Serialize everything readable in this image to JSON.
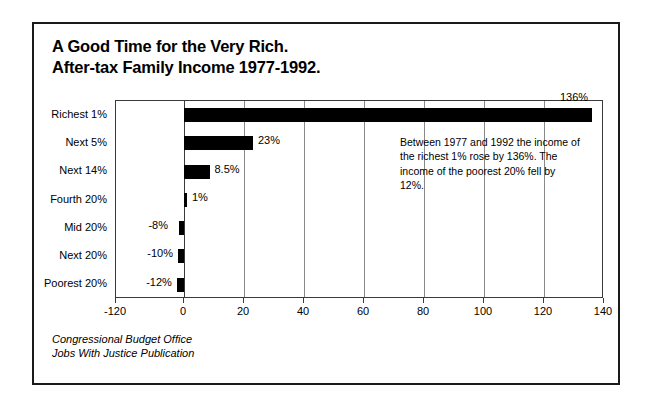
{
  "title": {
    "line1": "A Good Time for the Very Rich.",
    "line2": "After-tax Family Income 1977-1992."
  },
  "annotation": "Between 1977 and 1992 the income of the richest 1% rose by 136%. The income of the poorest 20% fell by 12%.",
  "footer": {
    "line1": "Congressional Budget Office",
    "line2": "Jobs With Justice Publication"
  },
  "chart_data": {
    "type": "bar",
    "orientation": "horizontal",
    "title": "A Good Time for the Very Rich. After-tax Family Income 1977-1992.",
    "xlabel": "",
    "ylabel": "",
    "xlim": [
      -120,
      140
    ],
    "grid": true,
    "legend": "none",
    "bar_color": "#000000",
    "categories": [
      "Richest 1%",
      "Next 5%",
      "Next 14%",
      "Fourth 20%",
      "Mid 20%",
      "Next 20%",
      "Poorest 20%"
    ],
    "values": [
      136,
      23,
      8.5,
      1,
      -8,
      -10,
      -12
    ],
    "data_labels": [
      "136%",
      "23%",
      "8.5%",
      "1%",
      "-8%",
      "-10%",
      "-12%"
    ],
    "xticks": [
      -120,
      0,
      20,
      40,
      60,
      80,
      100,
      120,
      140
    ],
    "xtick_labels": [
      "-120",
      "0",
      "20",
      "40",
      "60",
      "80",
      "100",
      "120",
      "140"
    ],
    "annotations": [
      "Between 1977 and 1992 the income of the richest 1% rose by 136%. The income of the poorest 20% fell by 12%."
    ]
  }
}
